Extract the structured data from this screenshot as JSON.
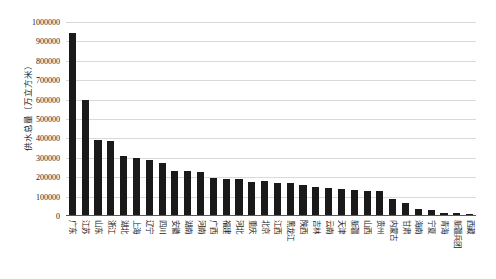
{
  "chart_data": {
    "type": "bar",
    "title": "",
    "subtitle": "",
    "xlabel": "",
    "ylabel": "供水总量（万立方米）",
    "ylim": [
      0,
      1000000
    ],
    "ytick_interval": 100000,
    "grid": true,
    "legend": "none",
    "orientation": "vertical",
    "bar_color": "#1a1a1a",
    "grid_color": "#d9d9d9",
    "axis_color": "#5a5a5a",
    "ytick_labels": [
      "1000000",
      "900000",
      "800000",
      "700000",
      "600000",
      "500000",
      "400000",
      "300000",
      "200000",
      "100000",
      "0"
    ],
    "ytick_values": [
      1000000,
      900000,
      800000,
      700000,
      600000,
      500000,
      400000,
      300000,
      200000,
      100000,
      0
    ],
    "categories": [
      "广东",
      "江苏",
      "山东",
      "浙江",
      "湖北",
      "上海",
      "辽宁",
      "四川",
      "安徽",
      "湖南",
      "河南",
      "广西",
      "福建",
      "河北",
      "重庆",
      "北京",
      "江西",
      "黑龙江",
      "陕西",
      "吉林",
      "云南",
      "天津",
      "新疆",
      "山西",
      "贵州",
      "内蒙古",
      "甘肃",
      "海南",
      "宁夏",
      "青海",
      "新疆兵团",
      "西藏"
    ],
    "values": [
      945000,
      600000,
      390000,
      388000,
      310000,
      300000,
      290000,
      272000,
      232000,
      233000,
      228000,
      196000,
      192000,
      190000,
      177000,
      178000,
      170000,
      168000,
      160000,
      152000,
      146000,
      140000,
      133000,
      130000,
      128000,
      86000,
      66000,
      36000,
      32000,
      18000,
      14000,
      12000
    ]
  }
}
